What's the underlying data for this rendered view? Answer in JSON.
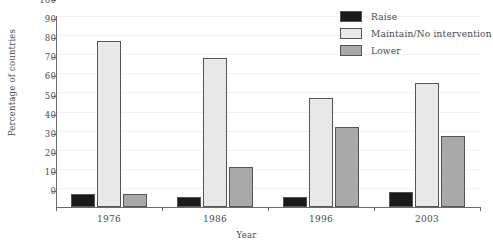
{
  "chart_data": {
    "type": "bar",
    "title": "",
    "xlabel": "Year",
    "ylabel": "Percentage of countries",
    "categories": [
      "1976",
      "1986",
      "1996",
      "2003"
    ],
    "series": [
      {
        "name": "Raise",
        "color": "#1a1a1a",
        "values": [
          7,
          5,
          5,
          8
        ]
      },
      {
        "name": "Maintain/No intervention",
        "color": "#e8e8e8",
        "values": [
          87,
          78,
          57,
          65
        ]
      },
      {
        "name": "Lower",
        "color": "#a9a9a9",
        "values": [
          7,
          21,
          42,
          37
        ]
      }
    ],
    "ylim": [
      0,
      100
    ],
    "yticks": [
      0,
      10,
      20,
      30,
      40,
      50,
      60,
      70,
      80,
      90,
      100
    ],
    "ytick_labels": [
      "0",
      "10",
      "20",
      "30",
      "40",
      "50",
      "60",
      "70",
      "80",
      "90",
      "100"
    ],
    "grid": true,
    "legend_position": "top-right"
  },
  "legend": {
    "items": [
      {
        "label": "Raise"
      },
      {
        "label": "Maintain/No intervention"
      },
      {
        "label": "Lower"
      }
    ]
  }
}
